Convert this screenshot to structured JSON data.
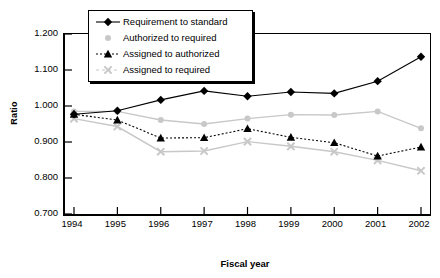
{
  "chart_data": {
    "type": "line",
    "title": "",
    "xlabel": "Fiscal year",
    "ylabel": "Ratio",
    "categories": [
      "1994",
      "1995",
      "1996",
      "1997",
      "1998",
      "1999",
      "2000",
      "2001",
      "2002"
    ],
    "x": [
      1994,
      1995,
      1996,
      1997,
      1998,
      1999,
      2000,
      2001,
      2002
    ],
    "ylim": [
      0.7,
      1.2
    ],
    "yticks": [
      "0.700",
      "0.800",
      "0.900",
      "1.000",
      "1.100",
      "1.200"
    ],
    "ytick_values": [
      0.7,
      0.8,
      0.9,
      1.0,
      1.1,
      1.2
    ],
    "grid": false,
    "legend_position": "top-left",
    "series": [
      {
        "name": "Requirement to standard",
        "marker": "diamond",
        "color": "#000000",
        "line_style": "solid",
        "values": [
          0.977,
          0.987,
          1.017,
          1.042,
          1.027,
          1.039,
          1.035,
          1.069,
          1.137
        ]
      },
      {
        "name": "Authorized to required",
        "marker": "circle",
        "color": "#c8c8c8",
        "line_style": "solid",
        "values": [
          0.985,
          0.985,
          0.961,
          0.95,
          0.965,
          0.976,
          0.975,
          0.985,
          0.938
        ]
      },
      {
        "name": "Assigned to authorized",
        "marker": "triangle",
        "color": "#000000",
        "line_style": "dashed",
        "values": [
          0.977,
          0.961,
          0.911,
          0.912,
          0.937,
          0.913,
          0.898,
          0.861,
          0.886
        ]
      },
      {
        "name": "Assigned to required",
        "marker": "cross",
        "color": "#c8c8c8",
        "line_style": "solid",
        "values": [
          0.965,
          0.943,
          0.873,
          0.875,
          0.901,
          0.888,
          0.873,
          0.849,
          0.82
        ]
      }
    ]
  },
  "legend": {
    "items": [
      {
        "label": "Requirement to standard",
        "marker": "diamond-marker-icon"
      },
      {
        "label": "Authorized to required",
        "marker": "circle-marker-icon"
      },
      {
        "label": "Assigned to authorized",
        "marker": "triangle-marker-icon"
      },
      {
        "label": "Assigned to required",
        "marker": "cross-marker-icon"
      }
    ]
  }
}
